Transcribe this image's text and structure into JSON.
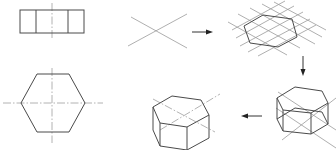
{
  "diagram": {
    "title": "",
    "colors": {
      "line": "#4a4a4a",
      "construction": "#9a9a9a",
      "background": "#ffffff"
    },
    "panels": [
      {
        "id": "front-view",
        "label": "",
        "kind": "rectangle-with-three-faces"
      },
      {
        "id": "top-view",
        "label": "",
        "kind": "hexagon-with-centerlines"
      },
      {
        "id": "step-1-axes",
        "label": "",
        "kind": "isometric-axes"
      },
      {
        "id": "step-2-hexagon-grid",
        "label": "",
        "kind": "isometric-hexagon-on-grid"
      },
      {
        "id": "step-3-prism-construction",
        "label": "",
        "kind": "prism-with-construction-lines"
      },
      {
        "id": "step-4-final-prism",
        "label": "",
        "kind": "finished-hexagonal-prism"
      }
    ],
    "arrows": [
      {
        "from": "step-1-axes",
        "to": "step-2-hexagon-grid",
        "direction": "right"
      },
      {
        "from": "step-2-hexagon-grid",
        "to": "step-3-prism-construction",
        "direction": "down"
      },
      {
        "from": "step-3-prism-construction",
        "to": "step-4-final-prism",
        "direction": "left"
      }
    ]
  }
}
